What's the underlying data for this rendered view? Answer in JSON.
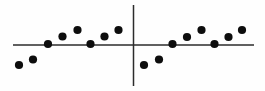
{
  "chart_data": {
    "type": "scatter",
    "title": "",
    "subtitle": "",
    "xlabel": "",
    "ylabel": "",
    "xlim": [
      -10,
      10
    ],
    "ylim": [
      -3,
      3
    ],
    "grid": false,
    "legend": null,
    "annotations": [],
    "axes": {
      "x_axis": {
        "name": "horizontal-axis",
        "y_value": 0,
        "x_start": -10.2,
        "x_end": 9.9,
        "color": "#2b2b2b"
      },
      "y_axis": {
        "name": "vertical-axis",
        "x_value": 0,
        "y_start": 2.7,
        "y_end": -2.7,
        "color": "#2b2b2b"
      }
    },
    "marker": {
      "shape": "circle",
      "color": "#0d0d0d",
      "radius_px": 4.1
    },
    "series": [
      {
        "name": "Series 1",
        "color": "#0d0d0d",
        "points": [
          {
            "x": -9.55,
            "y": -1.33,
            "px": 19,
            "py": 65
          },
          {
            "x": -8.35,
            "y": -0.93,
            "px": 33,
            "py": 59.5
          },
          {
            "x": -7.1,
            "y": 0.07,
            "px": 48,
            "py": 44
          },
          {
            "x": -5.9,
            "y": 0.6,
            "px": 62.5,
            "py": 36.5
          },
          {
            "x": -4.65,
            "y": 1.07,
            "px": 77.5,
            "py": 30
          },
          {
            "x": -3.55,
            "y": 0.07,
            "px": 90.5,
            "py": 44
          },
          {
            "x": -2.4,
            "y": 0.6,
            "px": 104.5,
            "py": 36.5
          },
          {
            "x": -1.2,
            "y": 1.07,
            "px": 118.5,
            "py": 30
          },
          {
            "x": 0.85,
            "y": -1.33,
            "px": 144,
            "py": 65
          },
          {
            "x": 2.1,
            "y": -0.93,
            "px": 159,
            "py": 59.5
          },
          {
            "x": 3.2,
            "y": 0.07,
            "px": 172.5,
            "py": 44
          },
          {
            "x": 4.4,
            "y": 0.53,
            "px": 187,
            "py": 37
          },
          {
            "x": 5.6,
            "y": 1.07,
            "px": 201.5,
            "py": 30
          },
          {
            "x": 6.65,
            "y": 0.07,
            "px": 214.5,
            "py": 44
          },
          {
            "x": 7.85,
            "y": 0.53,
            "px": 228.5,
            "py": 37
          },
          {
            "x": 9.0,
            "y": 1.07,
            "px": 242,
            "py": 30
          }
        ]
      }
    ],
    "tick_labels": {
      "x": [],
      "y": []
    }
  }
}
